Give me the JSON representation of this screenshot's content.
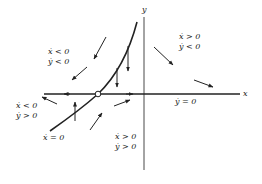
{
  "diagram": {
    "type": "phase-portrait",
    "axes": {
      "x_label": "x",
      "y_label": "y"
    },
    "nullclines": {
      "x_dot_zero": "ẋ = 0",
      "y_dot_zero": "ẏ = 0"
    },
    "regions": {
      "upper_left": {
        "line1": "ẋ < 0",
        "line2": "ẏ < 0"
      },
      "upper_right": {
        "line1": "ẋ > 0",
        "line2": "ẏ < 0"
      },
      "lower_left": {
        "line1": "ẋ < 0",
        "line2": "ẏ > 0"
      },
      "lower_right": {
        "line1": "ẋ > 0",
        "line2": "ẏ > 0"
      }
    },
    "fixed_point": "open-circle at intersection of nullclines",
    "colors": {
      "stroke": "#222222",
      "background": "#ffffff"
    }
  }
}
